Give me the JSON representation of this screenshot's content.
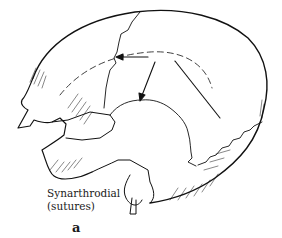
{
  "figure": {
    "caption_line1": "Synarthrodial",
    "caption_line2": "(sutures)",
    "panel_label": "a",
    "stroke_color": "#111111",
    "background_color": "#ffffff",
    "arrows": [
      {
        "target": "coronal suture",
        "direction": "left"
      },
      {
        "target": "squamous suture",
        "direction": "down"
      },
      {
        "target": "lambdoid suture",
        "direction": "down-right"
      }
    ]
  }
}
